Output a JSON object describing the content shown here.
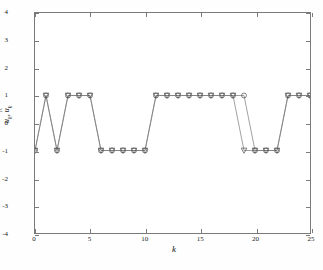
{
  "chart_data": {
    "type": "line",
    "title": "",
    "xlabel": "k",
    "ylabel": "u_k, û_k",
    "xlim": [
      0,
      25
    ],
    "ylim": [
      -4,
      4
    ],
    "xticks": [
      0,
      5,
      10,
      15,
      20,
      25
    ],
    "yticks": [
      -4,
      -3,
      -2,
      -1,
      0,
      1,
      2,
      3,
      4
    ],
    "xtick_labels": [
      "0",
      "5",
      "10",
      "15",
      "20",
      "25"
    ],
    "ytick_labels": [
      "-4",
      "-3",
      "-2",
      "-1",
      "0",
      "1",
      "2",
      "3",
      "4"
    ],
    "grid": false,
    "legend": null,
    "x": [
      0,
      1,
      2,
      3,
      4,
      5,
      6,
      7,
      8,
      9,
      10,
      11,
      12,
      13,
      14,
      15,
      16,
      17,
      18,
      19,
      20,
      21,
      22,
      23,
      24,
      25
    ],
    "series": [
      {
        "name": "u_k",
        "marker": "circle",
        "color": "#555555",
        "values": [
          -1,
          1,
          -1,
          1,
          1,
          1,
          -1,
          -1,
          -1,
          -1,
          -1,
          1,
          1,
          1,
          1,
          1,
          1,
          1,
          1,
          1,
          -1,
          -1,
          -1,
          1,
          1,
          1
        ]
      },
      {
        "name": "û_k",
        "marker": "triangle-down",
        "color": "#555555",
        "values": [
          -1,
          1,
          -1,
          1,
          1,
          1,
          -1,
          -1,
          -1,
          -1,
          -1,
          1,
          1,
          1,
          1,
          1,
          1,
          1,
          1,
          -1,
          -1,
          -1,
          -1,
          1,
          1,
          1
        ]
      }
    ],
    "line_color": "#777777",
    "marker_edge_color": "#4a4a4a",
    "axis_color": "#7a7a7a",
    "background": "#ffffff"
  },
  "axes": {
    "x_title": "k",
    "y_title_part1": "u",
    "y_title_sub1": "k",
    "y_title_sep": ", ",
    "y_title_part2": "u",
    "y_title_sub2": "k"
  }
}
